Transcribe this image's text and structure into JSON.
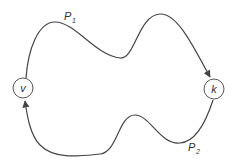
{
  "diagram": {
    "nodes": [
      {
        "id": "v",
        "label": "v",
        "cx": 23,
        "cy": 88,
        "r": 10
      },
      {
        "id": "k",
        "label": "k",
        "cx": 214,
        "cy": 89,
        "r": 10
      }
    ],
    "edges": [
      {
        "id": "P1",
        "label": "P",
        "subscript": "1",
        "from": "v",
        "to": "k"
      },
      {
        "id": "P2",
        "label": "P",
        "subscript": "2",
        "from": "k",
        "to": "v"
      }
    ],
    "colors": {
      "stroke": "#444444",
      "background": "#ffffff"
    }
  }
}
